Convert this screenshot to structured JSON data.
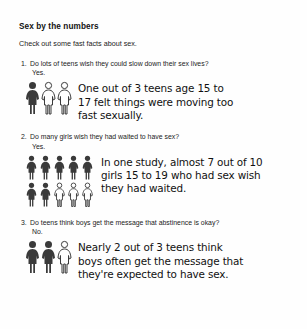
{
  "document": {
    "title": "Sex by the numbers",
    "intro": "Check out some fast facts about sex.",
    "items": [
      {
        "number": "1.",
        "question": "Do lots of teens wish they could slow down their sex lives?",
        "answer": "Yes.",
        "fact_lines": [
          "One out of 3 teens age 15 to",
          "17 felt things were moving too",
          "fast sexually."
        ],
        "pictogram": {
          "icon": "female-figure-icon",
          "total": 3,
          "filled": 1,
          "rows": [
            {
              "filled": 1,
              "outlined": 2
            }
          ]
        }
      },
      {
        "number": "2.",
        "question": "Do many girls wish they had waited to have sex?",
        "answer": "Yes.",
        "fact_lines": [
          "In one study, almost 7 out of 10",
          "girls 15 to 19 who had sex wish",
          "they had waited."
        ],
        "pictogram": {
          "icon": "female-figure-icon",
          "total": 10,
          "filled": 7,
          "rows": [
            {
              "filled": 5,
              "outlined": 0
            },
            {
              "filled": 2,
              "outlined": 3
            }
          ]
        }
      },
      {
        "number": "3.",
        "question": "Do teens think boys get the message that abstinence is okay?",
        "answer": "No.",
        "fact_lines": [
          "Nearly 2 out of 3 teens think",
          "boys often get the message that",
          "they're expected to have sex."
        ],
        "pictogram": {
          "icon": "female-figure-icon",
          "total": 3,
          "filled": 2,
          "rows": [
            {
              "filled": 2,
              "outlined": 1
            }
          ]
        }
      }
    ]
  },
  "colors": {
    "page_background": "#fefefe",
    "text": "#1a1a1a",
    "figure_filled": "#3a3a3a",
    "figure_outline": "#3a3a3a"
  }
}
